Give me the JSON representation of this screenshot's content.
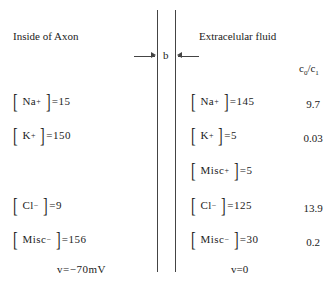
{
  "left": {
    "title": "Inside of Axon",
    "ions": [
      {
        "name": "Na",
        "charge": "+",
        "value": "15"
      },
      {
        "name": "K",
        "charge": "+",
        "value": "150"
      },
      {
        "name": "Cl",
        "charge": "−",
        "value": "9"
      },
      {
        "name": "Misc",
        "charge": "−",
        "value": "156"
      }
    ],
    "potential": "v=−70mV"
  },
  "right": {
    "title": "Extracelular fluid",
    "ions": [
      {
        "name": "Na",
        "charge": "+",
        "value": "145"
      },
      {
        "name": "K",
        "charge": "+",
        "value": "5"
      },
      {
        "name": "Misc",
        "charge": "+",
        "value": "5"
      },
      {
        "name": "Cl",
        "charge": "−",
        "value": "125"
      },
      {
        "name": "Misc",
        "charge": "−",
        "value": "30"
      }
    ],
    "potential": "v=0"
  },
  "membrane": {
    "label": "b"
  },
  "ratio": {
    "header_base": "c",
    "header_sub0": "0",
    "header_sub1": "1",
    "values": [
      "9.7",
      "0.03",
      "13.9",
      "0.2"
    ]
  }
}
